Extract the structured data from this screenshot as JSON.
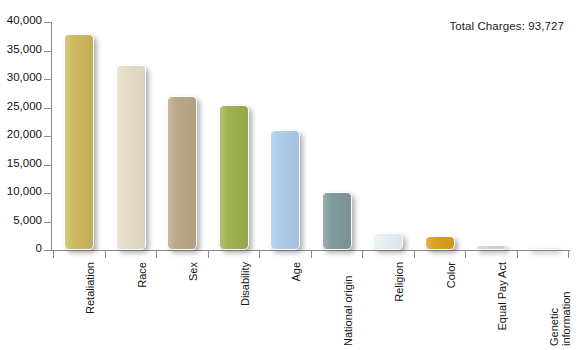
{
  "annotation": {
    "total_charges_label": "Total Charges: 93,727"
  },
  "chart_data": {
    "type": "bar",
    "title": "",
    "xlabel": "",
    "ylabel": "",
    "ylim": [
      0,
      40000
    ],
    "grid": false,
    "legend": "none",
    "ytick_labels": [
      "40,000",
      "35,000",
      "30,000",
      "25,000",
      "20,000",
      "15,000",
      "10,000",
      "5,000",
      "0"
    ],
    "ytick_values": [
      40000,
      35000,
      30000,
      25000,
      20000,
      15000,
      10000,
      5000,
      0
    ],
    "categories": [
      "Retaliation",
      "Race",
      "Sex",
      "Disability",
      "Age",
      "National origin",
      "Religion",
      "Color",
      "Equal Pay Act",
      "Genetic information"
    ],
    "values": [
      37955,
      32500,
      27000,
      25500,
      21000,
      10200,
      3000,
      2400,
      800,
      200
    ],
    "colors": [
      "#ccb85f",
      "#e4ddc9",
      "#b9a886",
      "#9cb14f",
      "#acccea",
      "#7f9a9a",
      "#e4f0f6",
      "#d9a01c",
      "#cfd8cd",
      "#f4f4f2"
    ]
  }
}
